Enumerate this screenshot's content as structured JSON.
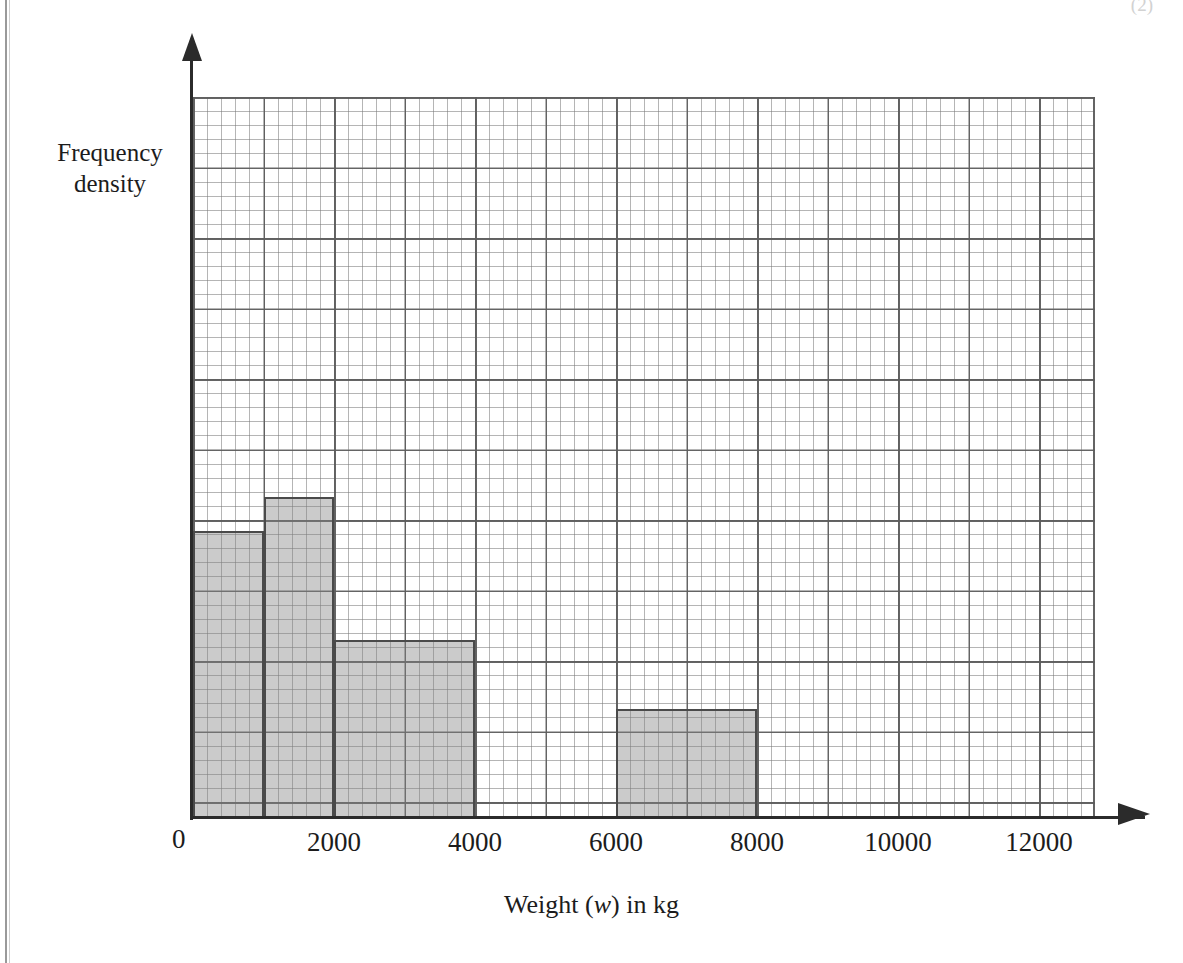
{
  "page": {
    "marks_note": "(2)",
    "background_color": "#ffffff",
    "rule_color": "#9a9a9a"
  },
  "chart_data": {
    "type": "bar",
    "title": "",
    "subtitle": "",
    "xlabel": "Weight (w) in kg",
    "ylabel": "Frequency density",
    "grid": true,
    "legend": null,
    "xlim": [
      0,
      13000
    ],
    "ylim": [
      0,
      5.15
    ],
    "x_tick_labels": [
      "0",
      "2000",
      "4000",
      "6000",
      "8000",
      "10000",
      "12000"
    ],
    "x_ticks": [
      0,
      2000,
      4000,
      6000,
      8000,
      10000,
      12000
    ],
    "y_tick_labels": [],
    "x_major_unit": 1000,
    "y_major_unit": 1,
    "y_minor_per_major": 5,
    "bar_fill_color": "#a9a9a9",
    "bar_edge_color": "#4a4a4a",
    "grid_minor_color": "#787878",
    "grid_major_color": "#5c5c5c",
    "bins": [
      {
        "label": "0 - 1000",
        "x_start": 0,
        "x_end": 1000,
        "frequency_density": 4.07
      },
      {
        "label": "1000 - 2000",
        "x_start": 1000,
        "x_end": 2000,
        "frequency_density": 4.56
      },
      {
        "label": "2000 - 4000",
        "x_start": 2000,
        "x_end": 4000,
        "frequency_density": 2.53
      },
      {
        "label": "6000 - 8000",
        "x_start": 6000,
        "x_end": 8000,
        "frequency_density": 1.54
      }
    ]
  },
  "axes": {
    "y_label_line1": "Frequency",
    "y_label_line2": "density",
    "x_title_prefix": "Weight (",
    "x_title_variable": "w",
    "x_title_suffix": ") in kg",
    "origin_label": "0"
  }
}
